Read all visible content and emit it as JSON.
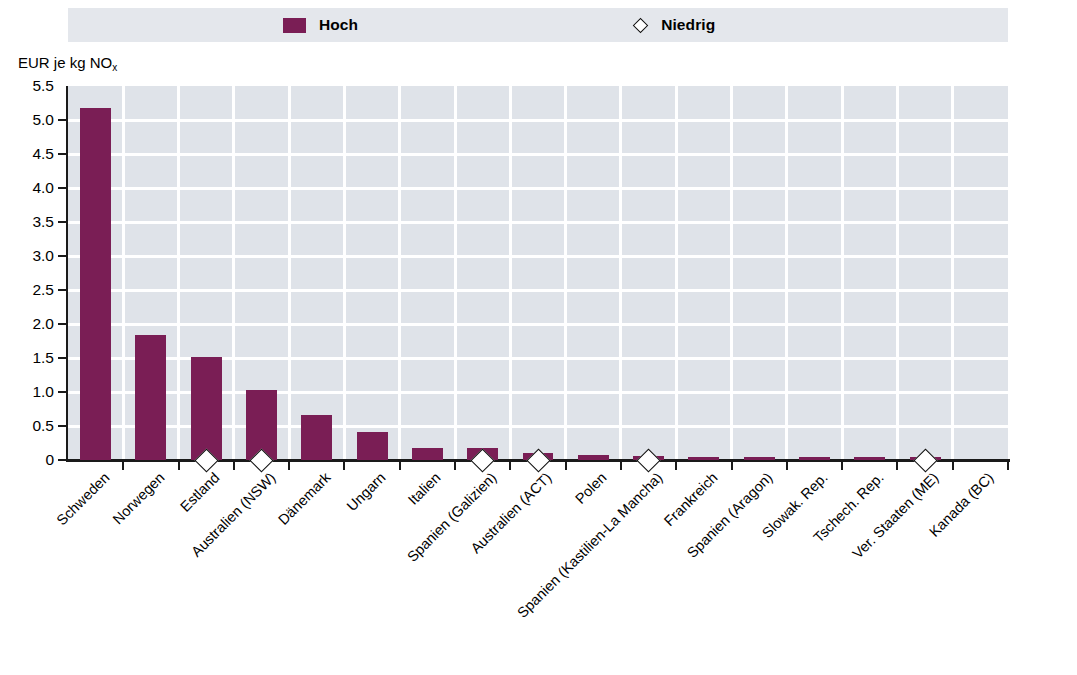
{
  "legend": {
    "items": [
      {
        "label": "Hoch",
        "marker": "square-swatch-icon",
        "color": "#7a1e55"
      },
      {
        "label": "Niedrig",
        "marker": "diamond-marker-icon",
        "color": "#ffffff"
      }
    ]
  },
  "axis": {
    "y_title_main": "EUR je kg NO",
    "y_title_sub": "x",
    "y_ticks": [
      "5.5",
      "5.0",
      "4.5",
      "4.0",
      "3.5",
      "3.0",
      "2.5",
      "2.0",
      "1.5",
      "1.0",
      "0.5",
      "0"
    ]
  },
  "colors": {
    "bar": "#7a1e55",
    "plot_background": "#dfe3e9",
    "gridline": "#ffffff",
    "legend_background": "#e4e7ec",
    "axis": "#1a1a1a"
  },
  "chart_data": {
    "type": "bar",
    "title": "",
    "xlabel": "",
    "ylabel": "EUR je kg NOx",
    "ylim": [
      0,
      5.5
    ],
    "ytick_step": 0.5,
    "grid": true,
    "legend_position": "top",
    "categories": [
      "Schweden",
      "Norwegen",
      "Estland",
      "Australien (NSW)",
      "Dänemark",
      "Ungarn",
      "Italien",
      "Spanien (Galizien)",
      "Australien (ACT)",
      "Polen",
      "Spanien (Kastilien-La Mancha)",
      "Frankreich",
      "Spanien (Aragon)",
      "Slowak. Rep.",
      "Tschech. Rep.",
      "Ver. Staaten (ME)",
      "Kanada (BC)"
    ],
    "series": [
      {
        "name": "Hoch",
        "type": "bar",
        "values": [
          5.18,
          1.84,
          1.52,
          1.03,
          0.66,
          0.41,
          0.18,
          0.18,
          0.1,
          0.07,
          0.06,
          0.04,
          0.03,
          0.02,
          0.02,
          0.01,
          0.0
        ]
      },
      {
        "name": "Niedrig",
        "type": "diamond-marker",
        "values": [
          null,
          null,
          0.0,
          0.0,
          null,
          null,
          null,
          0.0,
          0.0,
          null,
          0.0,
          null,
          null,
          null,
          null,
          0.0,
          null
        ]
      }
    ]
  }
}
